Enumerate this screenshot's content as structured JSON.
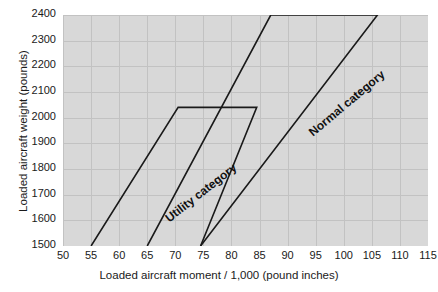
{
  "chart_data": {
    "type": "line",
    "title": "",
    "xlabel": "Loaded aircraft moment / 1,000 (pound inches)",
    "ylabel": "Loaded aircraft weight (pounds)",
    "xlim": [
      50,
      115
    ],
    "ylim": [
      1500,
      2400
    ],
    "xticks": [
      50,
      55,
      60,
      65,
      70,
      75,
      80,
      85,
      90,
      95,
      100,
      105,
      110,
      115
    ],
    "yticks": [
      1500,
      1600,
      1700,
      1800,
      1900,
      2000,
      2100,
      2200,
      2300,
      2400
    ],
    "grid": true,
    "legend_position": "in-plot-annotations",
    "plot_background": "#d8d8d8",
    "grid_color": "#c2c2c2",
    "line_color": "#1a1a1a",
    "series": [
      {
        "name": "Utility category",
        "label_rotation_deg": -38,
        "closed": false,
        "points": [
          {
            "x": 55.0,
            "y": 1500
          },
          {
            "x": 70.5,
            "y": 2040
          },
          {
            "x": 84.5,
            "y": 2040
          },
          {
            "x": 74.5,
            "y": 1500
          }
        ]
      },
      {
        "name": "Normal category",
        "label_rotation_deg": -40,
        "closed": false,
        "points": [
          {
            "x": 65.0,
            "y": 1500
          },
          {
            "x": 87.0,
            "y": 2400
          },
          {
            "x": 106.0,
            "y": 2400
          },
          {
            "x": 74.5,
            "y": 1500
          }
        ]
      }
    ],
    "annotations": [
      {
        "text": "Utility category",
        "x": 62,
        "y": 1780
      },
      {
        "text": "Normal category",
        "x": 89,
        "y": 2120
      }
    ]
  },
  "axes": {
    "x_title": "Loaded aircraft moment / 1,000 (pound inches)",
    "y_title": "Loaded aircraft weight (pounds)",
    "x_tick_labels": [
      "50",
      "55",
      "60",
      "65",
      "70",
      "75",
      "80",
      "85",
      "90",
      "95",
      "100",
      "105",
      "110",
      "115"
    ],
    "y_tick_labels": [
      "2400",
      "2300",
      "2200",
      "2100",
      "2000",
      "1900",
      "1800",
      "1700",
      "1600",
      "1500"
    ]
  },
  "labels": {
    "utility": "Utility category",
    "normal": "Normal category"
  }
}
